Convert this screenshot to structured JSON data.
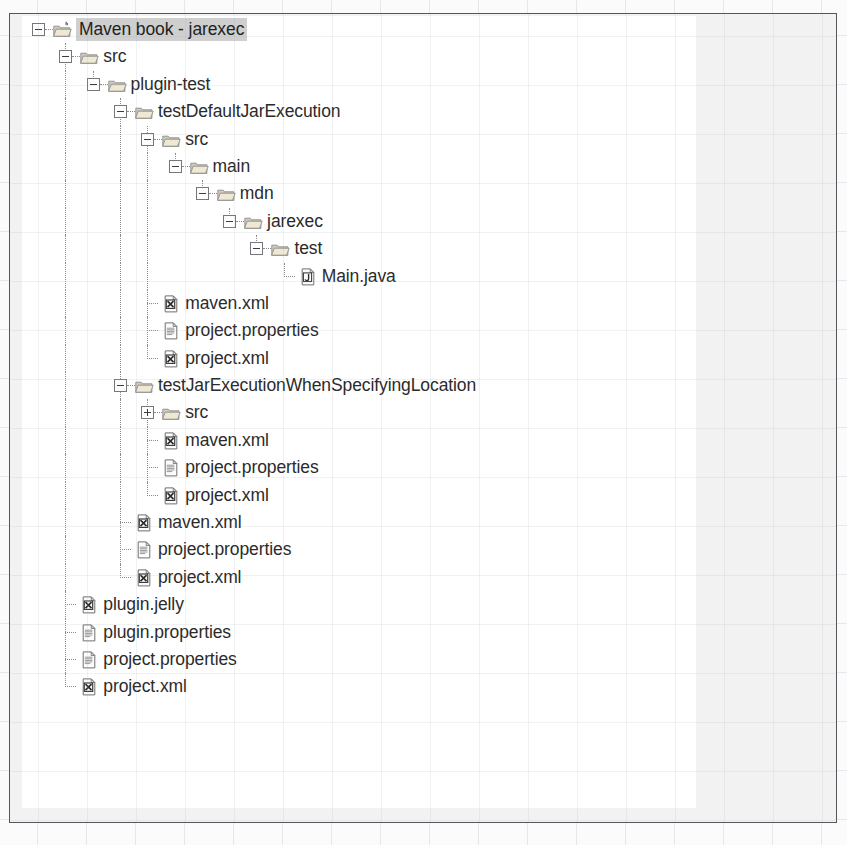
{
  "figure": {
    "kind": "eclipse-package-explorer-tree-screenshot",
    "selected_item": "Maven book - jarexec"
  },
  "tree": {
    "nodes": [
      {
        "label": "Maven book - jarexec",
        "depth": 0,
        "icon": "java-project-icon",
        "toggle": "minus",
        "selected": true
      },
      {
        "label": "src",
        "depth": 1,
        "icon": "folder-icon",
        "toggle": "minus",
        "selected": false
      },
      {
        "label": "plugin-test",
        "depth": 2,
        "icon": "folder-icon",
        "toggle": "minus",
        "selected": false
      },
      {
        "label": "testDefaultJarExecution",
        "depth": 3,
        "icon": "folder-icon",
        "toggle": "minus",
        "selected": false
      },
      {
        "label": "src",
        "depth": 4,
        "icon": "folder-icon",
        "toggle": "minus",
        "selected": false
      },
      {
        "label": "main",
        "depth": 5,
        "icon": "folder-icon",
        "toggle": "minus",
        "selected": false
      },
      {
        "label": "mdn",
        "depth": 6,
        "icon": "folder-icon",
        "toggle": "minus",
        "selected": false
      },
      {
        "label": "jarexec",
        "depth": 7,
        "icon": "folder-icon",
        "toggle": "minus",
        "selected": false
      },
      {
        "label": "test",
        "depth": 8,
        "icon": "folder-icon",
        "toggle": "minus",
        "selected": false
      },
      {
        "label": "Main.java",
        "depth": 9,
        "icon": "java-file-icon",
        "toggle": "none",
        "selected": false
      },
      {
        "label": "maven.xml",
        "depth": 4,
        "icon": "xml-file-icon",
        "toggle": "none",
        "selected": false
      },
      {
        "label": "project.properties",
        "depth": 4,
        "icon": "properties-file-icon",
        "toggle": "none",
        "selected": false
      },
      {
        "label": "project.xml",
        "depth": 4,
        "icon": "xml-file-icon",
        "toggle": "none",
        "selected": false
      },
      {
        "label": "testJarExecutionWhenSpecifyingLocation",
        "depth": 3,
        "icon": "folder-icon",
        "toggle": "minus",
        "selected": false
      },
      {
        "label": "src",
        "depth": 4,
        "icon": "folder-icon",
        "toggle": "plus",
        "selected": false
      },
      {
        "label": "maven.xml",
        "depth": 4,
        "icon": "xml-file-icon",
        "toggle": "none",
        "selected": false
      },
      {
        "label": "project.properties",
        "depth": 4,
        "icon": "properties-file-icon",
        "toggle": "none",
        "selected": false
      },
      {
        "label": "project.xml",
        "depth": 4,
        "icon": "xml-file-icon",
        "toggle": "none",
        "selected": false
      },
      {
        "label": "maven.xml",
        "depth": 3,
        "icon": "xml-file-icon",
        "toggle": "none",
        "selected": false
      },
      {
        "label": "project.properties",
        "depth": 3,
        "icon": "properties-file-icon",
        "toggle": "none",
        "selected": false
      },
      {
        "label": "project.xml",
        "depth": 3,
        "icon": "xml-file-icon",
        "toggle": "none",
        "selected": false
      },
      {
        "label": "plugin.jelly",
        "depth": 1,
        "icon": "xml-file-icon",
        "toggle": "none",
        "selected": false
      },
      {
        "label": "plugin.properties",
        "depth": 1,
        "icon": "properties-file-icon",
        "toggle": "none",
        "selected": false
      },
      {
        "label": "project.properties",
        "depth": 1,
        "icon": "properties-file-icon",
        "toggle": "none",
        "selected": false
      },
      {
        "label": "project.xml",
        "depth": 1,
        "icon": "xml-file-icon",
        "toggle": "none",
        "selected": false
      }
    ]
  },
  "colors": {
    "selection_background": "#cfcfcf",
    "text": "#2b2b2b",
    "tree_line": "#8a8a8a",
    "folder_body": "#e6dfc8",
    "folder_edge": "#8d8d8d",
    "panel_background": "#ffffff",
    "page_background": "#f2f2f2",
    "figure_border": "#53565a"
  }
}
